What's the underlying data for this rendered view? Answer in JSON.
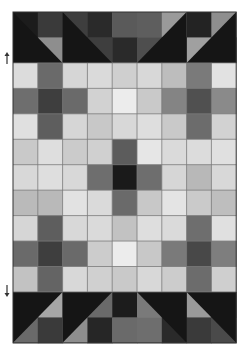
{
  "grid": {
    "left": 13,
    "top": 12,
    "cols": 9,
    "cell_w": 24.8,
    "cell_h": 25.45,
    "line_color": "#7a7a7a",
    "border_color": "#333333"
  },
  "top_band": {
    "rows": [
      [
        "#1c1c1c",
        "#3a3a3a",
        "#3e3e3e",
        "#2a2a2a",
        "#5a5a5a",
        "#5e5e5e",
        "#9a9a9a",
        "#232323",
        "#8e8e8e"
      ],
      [
        "#1c1c1c",
        "#8e8e8e",
        "#1c1c1c",
        "#3e3e3e",
        "#2a2a2a",
        "#4e4e4e",
        "#1c1c1c",
        "#a0a0a0",
        "#1c1c1c"
      ]
    ],
    "dark_color": "#151515"
  },
  "middle": {
    "rows": [
      [
        "#dcdcdc",
        "#6a6a6a",
        "#d6d6d6",
        "#dadada",
        "#cfcfcf",
        "#d8d8d8",
        "#bdbdbd",
        "#7a7a7a",
        "#e2e2e2"
      ],
      [
        "#6e6e6e",
        "#3e3e3e",
        "#6a6a6a",
        "#d2d2d2",
        "#ececec",
        "#c9c9c9",
        "#848484",
        "#505050",
        "#8a8a8a"
      ],
      [
        "#e0e0e0",
        "#5e5e5e",
        "#d6d6d6",
        "#c8c8c8",
        "#d8d8d8",
        "#dedede",
        "#c9c9c9",
        "#6c6c6c",
        "#d2d2d2"
      ],
      [
        "#c9c9c9",
        "#dedede",
        "#cbcbcb",
        "#d0d0d0",
        "#5c5c5c",
        "#e6e6e6",
        "#dadada",
        "#dcdcdc",
        "#e0e0e0"
      ],
      [
        "#d8d8d8",
        "#dedede",
        "#d8d8d8",
        "#6e6e6e",
        "#1a1a1a",
        "#6e6e6e",
        "#d6d6d6",
        "#b8b8b8",
        "#d8d8d8"
      ],
      [
        "#bababa",
        "#b9b9b9",
        "#e2e2e2",
        "#dadada",
        "#6a6a6a",
        "#c8c8c8",
        "#e4e4e4",
        "#cacaca",
        "#bebebe"
      ],
      [
        "#d6d6d6",
        "#5e5e5e",
        "#d8d8d8",
        "#dadada",
        "#c2c2c2",
        "#dedede",
        "#dadada",
        "#6e6e6e",
        "#e0e0e0"
      ],
      [
        "#6a6a6a",
        "#3e3e3e",
        "#6a6a6a",
        "#cccccc",
        "#ececec",
        "#c8c8c8",
        "#7a7a7a",
        "#484848",
        "#7e7e7e"
      ],
      [
        "#c2c2c2",
        "#646464",
        "#d8d8d8",
        "#d0d0d0",
        "#c9c9c9",
        "#d8d8d8",
        "#cccccc",
        "#6c6c6c",
        "#cfcfcf"
      ]
    ]
  },
  "bottom_band": {
    "rows": [
      [
        "#1c1c1c",
        "#a6a6a6",
        "#1c1c1c",
        "#6a6a6a",
        "#1c1c1c",
        "#7a7a7a",
        "#1c1c1c",
        "#9a9a9a",
        "#1c1c1c"
      ],
      [
        "#6a6a6a",
        "#3a3a3a",
        "#8e8e8e",
        "#262626",
        "#6a6a6a",
        "#6e6e6e",
        "#2a2a2a",
        "#3a3a3a",
        "#4a4a4a"
      ]
    ],
    "dark_color": "#151515"
  },
  "arrows": {
    "up": {
      "icon": "arrow-up-icon",
      "color": "#333333"
    },
    "down": {
      "icon": "arrow-down-icon",
      "color": "#333333"
    }
  }
}
